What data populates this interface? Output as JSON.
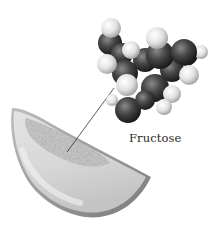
{
  "figure": {
    "label": "Fructose",
    "elements": {
      "molecule": "fructose space-filling model",
      "fruit": "melon slice",
      "connector": "pointer line"
    },
    "colors": {
      "background": "#ffffff",
      "carbon_oxygen_atom": "#3a3a3a",
      "hydrogen_atom": "#e6e6e6",
      "melon_rind": "#9a9a9a",
      "melon_flesh": "#d8d8d8",
      "pointer_line": "#333333",
      "label_text": "#2a2a2a"
    }
  }
}
